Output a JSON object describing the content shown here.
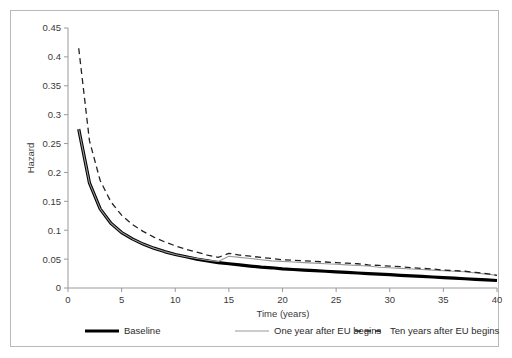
{
  "chart_data": {
    "type": "line",
    "title": "",
    "xlabel": "Time (years)",
    "ylabel": "Hazard",
    "xlim": [
      0,
      40
    ],
    "ylim": [
      0,
      0.45
    ],
    "grid": false,
    "legend_position": "bottom",
    "xticks": [
      "0",
      "5",
      "10",
      "15",
      "20",
      "25",
      "30",
      "35",
      "40"
    ],
    "xtick_values": [
      0,
      5,
      10,
      15,
      20,
      25,
      30,
      35,
      40
    ],
    "yticks": [
      "0",
      "0.05",
      "0.1",
      "0.15",
      "0.2",
      "0.25",
      "0.3",
      "0.35",
      "0.4",
      "0.45"
    ],
    "ytick_values": [
      0,
      0.05,
      0.1,
      0.15,
      0.2,
      0.25,
      0.3,
      0.35,
      0.4,
      0.45
    ],
    "x": [
      1,
      2,
      3,
      4,
      5,
      6,
      7,
      8,
      9,
      10,
      11,
      12,
      13,
      14,
      15,
      16,
      17,
      18,
      19,
      20,
      21,
      22,
      23,
      24,
      25,
      26,
      27,
      28,
      29,
      30,
      31,
      32,
      33,
      34,
      35,
      36,
      37,
      38,
      39,
      40
    ],
    "series": [
      {
        "name": "Baseline",
        "style": "thick-solid",
        "color": "#000000",
        "values": [
          0.275,
          0.182,
          0.137,
          0.112,
          0.096,
          0.085,
          0.076,
          0.069,
          0.063,
          0.058,
          0.054,
          0.05,
          0.047,
          0.044,
          0.042,
          0.04,
          0.038,
          0.036,
          0.035,
          0.033,
          0.032,
          0.031,
          0.03,
          0.029,
          0.028,
          0.027,
          0.026,
          0.025,
          0.024,
          0.023,
          0.022,
          0.021,
          0.02,
          0.019,
          0.018,
          0.017,
          0.016,
          0.015,
          0.014,
          0.013
        ]
      },
      {
        "name": "One year after EU begins",
        "style": "thin-solid",
        "color": "#999999",
        "values": [
          0.275,
          0.182,
          0.137,
          0.112,
          0.096,
          0.085,
          0.076,
          0.069,
          0.063,
          0.058,
          0.054,
          0.051,
          0.048,
          0.046,
          0.055,
          0.053,
          0.051,
          0.049,
          0.047,
          0.046,
          0.045,
          0.044,
          0.043,
          0.042,
          0.041,
          0.04,
          0.039,
          0.038,
          0.036,
          0.035,
          0.034,
          0.033,
          0.032,
          0.031,
          0.03,
          0.029,
          0.028,
          0.026,
          0.024,
          0.022
        ]
      },
      {
        "name": "Ten years after EU begins",
        "style": "dashed",
        "color": "#222222",
        "values": [
          0.415,
          0.255,
          0.186,
          0.149,
          0.126,
          0.11,
          0.098,
          0.088,
          0.08,
          0.073,
          0.067,
          0.062,
          0.057,
          0.053,
          0.06,
          0.057,
          0.055,
          0.053,
          0.051,
          0.049,
          0.048,
          0.047,
          0.046,
          0.045,
          0.044,
          0.043,
          0.042,
          0.04,
          0.039,
          0.038,
          0.037,
          0.035,
          0.034,
          0.033,
          0.031,
          0.03,
          0.029,
          0.027,
          0.025,
          0.022
        ]
      }
    ],
    "legend": [
      {
        "label": "Baseline",
        "style": "thick-solid"
      },
      {
        "label": "One year after EU begins",
        "style": "thin-solid"
      },
      {
        "label": "Ten years after EU begins",
        "style": "dashed"
      }
    ]
  },
  "colors": {
    "baseline": "#000000",
    "one_year": "#999999",
    "ten_years": "#222222",
    "axis": "#9a9a9a",
    "text": "#3a3a3a",
    "border": "#b9b9b9"
  }
}
